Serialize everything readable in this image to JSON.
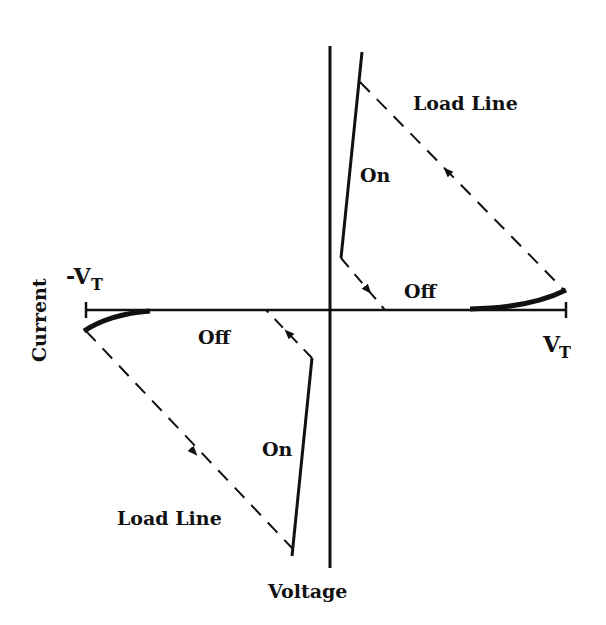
{
  "diagram": {
    "type": "I-V characteristic (bidirectional switching device)",
    "axes": {
      "x_label": "Voltage",
      "y_label": "Current",
      "x_positive_limit": "VT",
      "x_negative_limit": "-VT"
    },
    "labels": {
      "load_line_top": "Load Line",
      "load_line_bottom": "Load Line",
      "on_top": "On",
      "on_bottom": "On",
      "off_right": "Off",
      "off_left": "Off",
      "vt_pos_main": "V",
      "vt_pos_sub": "T",
      "vt_neg_main": "-V",
      "vt_neg_sub": "T"
    },
    "colors": {
      "line": "#111111",
      "background": "#ffffff"
    }
  }
}
